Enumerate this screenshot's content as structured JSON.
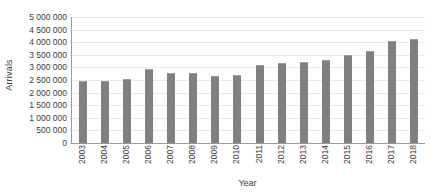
{
  "chart_data": {
    "type": "bar",
    "title": "",
    "xlabel": "Year",
    "ylabel": "Arrivals",
    "categories": [
      "2003",
      "2004",
      "2005",
      "2006",
      "2007",
      "2008",
      "2009",
      "2010",
      "2011",
      "2012",
      "2013",
      "2014",
      "2015",
      "2016",
      "2017",
      "2018"
    ],
    "values": [
      2450000,
      2470000,
      2530000,
      2950000,
      2790000,
      2760000,
      2650000,
      2700000,
      3080000,
      3180000,
      3200000,
      3300000,
      3490000,
      3650000,
      4050000,
      4120000
    ],
    "series": [
      {
        "name": "Arrivals",
        "values": [
          2450000,
          2470000,
          2530000,
          2950000,
          2790000,
          2760000,
          2650000,
          2700000,
          3080000,
          3180000,
          3200000,
          3300000,
          3490000,
          3650000,
          4050000,
          4120000
        ]
      }
    ],
    "ylim": [
      0,
      5000000
    ],
    "y_ticks": [
      0,
      500000,
      1000000,
      1500000,
      2000000,
      2500000,
      3000000,
      3500000,
      4000000,
      4500000,
      5000000
    ],
    "y_tick_labels": [
      "0",
      "500 000",
      "1 000 000",
      "1 500 000",
      "2 000 000",
      "2 500 000",
      "3 000 000",
      "3 500 000",
      "4 000 000",
      "4 500 000",
      "5 000 000"
    ],
    "grid": true,
    "legend": false,
    "legend_position": "none",
    "bar_color": "#808080",
    "gridline_color": "#e9e9e9",
    "axis_color": "#9a9a9a",
    "text_color": "#3b3b3b"
  }
}
